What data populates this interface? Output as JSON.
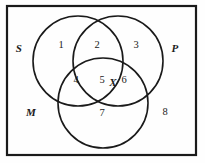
{
  "figure": {
    "type": "venn-diagram",
    "background_color": "#fefefe",
    "stroke_color": "#1a1a1a",
    "border": {
      "name": "universe-rectangle",
      "x": 7,
      "y": 6,
      "width": 189,
      "height": 149,
      "stroke_width": 2.2
    },
    "circles": [
      {
        "id": "S",
        "name": "circle-s",
        "cx": 78,
        "cy": 61,
        "r": 45,
        "stroke_width": 1.6
      },
      {
        "id": "P",
        "name": "circle-p",
        "cx": 118,
        "cy": 61,
        "r": 45,
        "stroke_width": 1.6
      },
      {
        "id": "M",
        "name": "circle-m",
        "cx": 103,
        "cy": 103,
        "r": 45,
        "stroke_width": 1.6
      }
    ],
    "set_labels": [
      {
        "id": "S",
        "text": "S",
        "x": 19,
        "y": 48
      },
      {
        "id": "P",
        "text": "P",
        "x": 175,
        "y": 48
      },
      {
        "id": "M",
        "text": "M",
        "x": 31,
        "y": 112
      }
    ],
    "region_labels": [
      {
        "id": "1",
        "text": "1",
        "x": 61,
        "y": 45,
        "meaning": "S only"
      },
      {
        "id": "2",
        "text": "2",
        "x": 97,
        "y": 45,
        "meaning": "S and P only"
      },
      {
        "id": "3",
        "text": "3",
        "x": 136,
        "y": 45,
        "meaning": "P only"
      },
      {
        "id": "4",
        "text": "4",
        "x": 76,
        "y": 80,
        "meaning": "S and M only"
      },
      {
        "id": "5",
        "text": "5",
        "x": 102,
        "y": 80,
        "meaning": "S and P and M"
      },
      {
        "id": "6",
        "text": "6",
        "x": 124,
        "y": 80,
        "meaning": "P and M only"
      },
      {
        "id": "7",
        "text": "7",
        "x": 102,
        "y": 113,
        "meaning": "M only"
      },
      {
        "id": "8",
        "text": "8",
        "x": 165,
        "y": 112,
        "meaning": "outside all sets"
      }
    ],
    "marks": [
      {
        "id": "X",
        "text": "X",
        "x": 113,
        "y": 82,
        "meaning": "x placed on boundary between region 5 and region 6"
      }
    ]
  }
}
